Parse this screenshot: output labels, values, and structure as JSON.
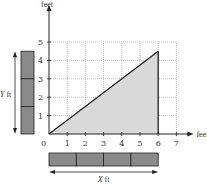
{
  "chart_data": {
    "type": "area",
    "title": "",
    "xlabel": "feet",
    "ylabel": "feet",
    "xlim": [
      0,
      7
    ],
    "ylim": [
      0,
      5
    ],
    "grid": true,
    "x_ticks": [
      "1",
      "2",
      "3",
      "4",
      "5",
      "6",
      "7"
    ],
    "y_ticks": [
      "1",
      "2",
      "3",
      "4",
      "5"
    ],
    "origin_label": "0",
    "series": [
      {
        "name": "hypotenuse",
        "points": [
          [
            0,
            0
          ],
          [
            6,
            4.5
          ]
        ]
      }
    ],
    "shaded_region": {
      "vertices": [
        [
          0,
          0
        ],
        [
          6,
          0
        ],
        [
          6,
          4.5
        ]
      ],
      "fill": "#d9d9d9"
    },
    "annotations": {
      "x_bar": {
        "segments": 4,
        "label_var": "X",
        "label_unit": " ft"
      },
      "y_bar": {
        "segments": 3,
        "label_var": "Y",
        "label_unit": " ft"
      }
    }
  },
  "colors": {
    "line": "#222222",
    "grid": "#999999",
    "bar_fill": "#8a8a8a",
    "bar_stroke": "#222222",
    "shade": "#d9d9d9"
  }
}
